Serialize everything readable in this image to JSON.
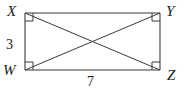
{
  "figure": {
    "type": "geometry-diagram",
    "shape": "rectangle-with-diagonals",
    "background_color": "#ffffff",
    "stroke_color": "#3b3b3b",
    "text_color": "#1a1a1a",
    "vertices": [
      {
        "id": "X",
        "label": "X",
        "position": "top-left",
        "x": 25,
        "y": 13,
        "right_angle_mark": true
      },
      {
        "id": "Y",
        "label": "Y",
        "position": "top-right",
        "x": 160,
        "y": 13,
        "right_angle_mark": true
      },
      {
        "id": "Z",
        "label": "Z",
        "position": "bottom-right",
        "x": 160,
        "y": 70,
        "right_angle_mark": true
      },
      {
        "id": "W",
        "label": "W",
        "position": "bottom-left",
        "x": 25,
        "y": 70,
        "right_angle_mark": true
      }
    ],
    "sides": [
      {
        "id": "XY",
        "from": "X",
        "to": "Y",
        "label": ""
      },
      {
        "id": "YZ",
        "from": "Y",
        "to": "Z",
        "label": ""
      },
      {
        "id": "WZ",
        "from": "W",
        "to": "Z",
        "label": "7"
      },
      {
        "id": "XW",
        "from": "X",
        "to": "W",
        "label": "3"
      }
    ],
    "diagonals": [
      {
        "id": "XZ",
        "from": "X",
        "to": "Z"
      },
      {
        "id": "WY",
        "from": "W",
        "to": "Y"
      }
    ],
    "measures": {
      "height_label": "3",
      "width_label": "7"
    }
  }
}
